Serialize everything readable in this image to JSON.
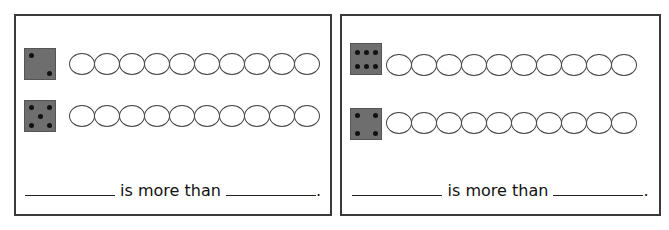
{
  "worksheet": {
    "cards": [
      {
        "rows": [
          {
            "die_value": 2,
            "ten_frame_count": 10
          },
          {
            "die_value": 5,
            "ten_frame_count": 10
          }
        ],
        "sentence": {
          "blank1": "",
          "middle": "is more than",
          "blank2": "",
          "end": "."
        }
      },
      {
        "rows": [
          {
            "die_value": 6,
            "ten_frame_count": 10
          },
          {
            "die_value": 4,
            "ten_frame_count": 10
          }
        ],
        "sentence": {
          "blank1": "",
          "middle": "is more than",
          "blank2": "",
          "end": "."
        }
      }
    ]
  }
}
